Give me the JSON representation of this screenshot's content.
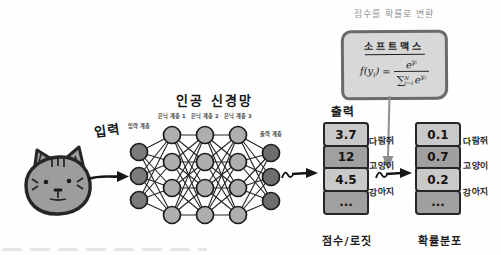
{
  "colors": {
    "ink": "#1d1d1d",
    "node_input": "#7a7a7a",
    "node_hidden": "#aeaeae",
    "node_output": "#6e6e6e",
    "edge": "#232323",
    "cat_fill": "#9d9d9d",
    "softmax_box_bg": "#d8d8d8",
    "softmax_box_border": "#6a6a6a",
    "cell_light": "#c9c9c9",
    "cell_dark": "#a0a0a0",
    "gray_arrow": "#8f8f8f",
    "caption_gray": "#979797"
  },
  "input": {
    "label": "입력"
  },
  "network": {
    "title": "인공 신경망",
    "layer_labels": [
      "입력 계층",
      "은닉 계층 1",
      "은닉 계층 2",
      "은닉 계층 3",
      "출력 계층"
    ]
  },
  "softmax": {
    "caption": "점수를 확률로 변환",
    "title": "소프트맥스",
    "formula": {
      "lhs": "f(y",
      "lhs_sub": "i",
      "lhs_close": ")",
      "equals": "=",
      "num_base": "e",
      "num_exp": "yᵢ",
      "sum": "∑",
      "sum_sup": "N",
      "sum_sub": "j=1",
      "den_base": "e",
      "den_exp": "yⱼ"
    }
  },
  "output_label": "출력",
  "scores": {
    "values": [
      "3.7",
      "12",
      "4.5",
      "..."
    ],
    "labels": [
      "다람쥐",
      "고양이",
      "강아지"
    ],
    "caption": "점수/로짓"
  },
  "probabilities": {
    "values": [
      "0.1",
      "0.7",
      "0.2",
      "..."
    ],
    "labels": [
      "다람쥐",
      "고양이",
      "강아지"
    ],
    "caption": "확률분포"
  }
}
